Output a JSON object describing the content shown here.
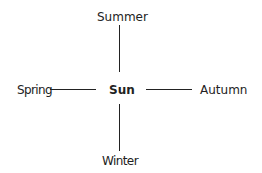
{
  "diagram": {
    "center": {
      "label": "Sun"
    },
    "nodes": {
      "top": {
        "label": "Summer"
      },
      "left": {
        "label": "Spring"
      },
      "right": {
        "label": "Autumn"
      },
      "bottom": {
        "label": "Winter"
      }
    },
    "colors": {
      "text": "#222222",
      "line": "#222222",
      "background": "#ffffff"
    }
  }
}
